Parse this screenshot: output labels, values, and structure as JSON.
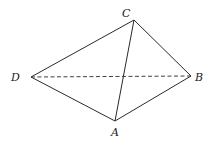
{
  "diagram": {
    "type": "tetrahedron",
    "vertices": [
      {
        "id": "A",
        "label": "A"
      },
      {
        "id": "B",
        "label": "B"
      },
      {
        "id": "C",
        "label": "C"
      },
      {
        "id": "D",
        "label": "D"
      }
    ],
    "edges": [
      {
        "from": "D",
        "to": "C",
        "style": "solid"
      },
      {
        "from": "C",
        "to": "B",
        "style": "solid"
      },
      {
        "from": "B",
        "to": "A",
        "style": "solid"
      },
      {
        "from": "A",
        "to": "D",
        "style": "solid"
      },
      {
        "from": "C",
        "to": "A",
        "style": "solid"
      },
      {
        "from": "D",
        "to": "B",
        "style": "dashed"
      }
    ]
  }
}
